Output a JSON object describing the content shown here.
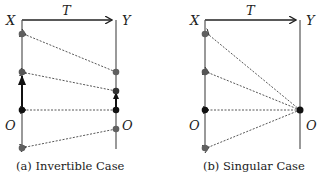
{
  "panels": [
    {
      "caption": "(a) Invertible Case",
      "labels": {
        "x": "X",
        "y": "Y",
        "t": "T",
        "o_left": "O",
        "o_right": "O"
      }
    },
    {
      "caption": "(b) Singular Case",
      "labels": {
        "x": "X",
        "y": "Y",
        "t": "T",
        "o_left": "O",
        "o_right": "O"
      }
    }
  ],
  "colors": {
    "line": "#555555",
    "gray_point": "#606060",
    "black_point": "#111111",
    "dashed": "#444444"
  }
}
